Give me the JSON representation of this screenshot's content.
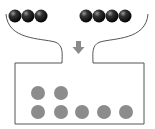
{
  "diagram": {
    "top_group_left": {
      "count": 3,
      "color": "#1a1a1a",
      "cx": [
        15,
        28,
        41
      ],
      "cy": 16,
      "r": 6.5
    },
    "top_group_right": {
      "count": 4,
      "color": "#1a1a1a",
      "cx": [
        86,
        99,
        112,
        125
      ],
      "cy": 16,
      "r": 6.5
    },
    "arrow": {
      "direction": "down",
      "color": "#8a8a8a"
    },
    "box": {
      "stroke": "#555555"
    },
    "bottom_balls": {
      "count": 7,
      "color": "#8c8c8c",
      "rows": [
        {
          "cy": 93,
          "cx": [
            38,
            61
          ]
        },
        {
          "cy": 112,
          "cx": [
            38,
            61,
            82,
            104,
            126
          ]
        }
      ],
      "r": 7
    }
  }
}
